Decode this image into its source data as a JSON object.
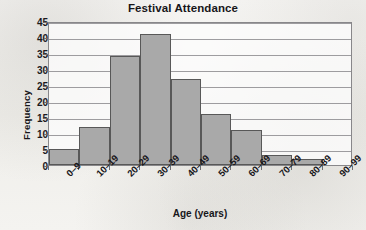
{
  "chart_data": {
    "type": "bar",
    "title": "Festival Attendance",
    "xlabel": "Age (years)",
    "ylabel": "Frequency",
    "categories": [
      "0–9",
      "10–19",
      "20–29",
      "30–39",
      "40–49",
      "50–59",
      "60–69",
      "70–79",
      "80–89",
      "90–99"
    ],
    "values": [
      5,
      12,
      34,
      41,
      27,
      16,
      11,
      3,
      2,
      0
    ],
    "ylim": [
      0,
      45
    ],
    "yticks": [
      0,
      5,
      10,
      15,
      20,
      25,
      30,
      35,
      40,
      45
    ],
    "grid": true,
    "legend": false,
    "bar_color": "#a9a9a9",
    "bar_edge_color": "#585858",
    "gridline_color": "#8d8c8f",
    "axis_color": "#88878a",
    "text_color": "#17161a",
    "background_color": "#f2f1ee",
    "plot_background_color": "#fdfdfc"
  }
}
